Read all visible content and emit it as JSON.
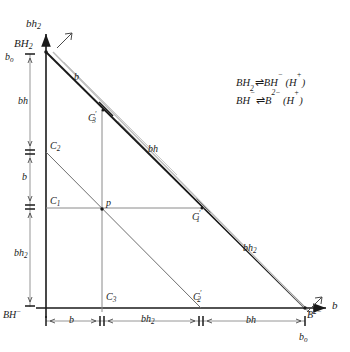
{
  "figure": {
    "axes": {
      "y_axis_label": "bh2",
      "x_axis_label": "b",
      "origin_label": "BH-",
      "apex_label": "BH2",
      "corner_label": "B2-",
      "apex_offset_label": "bo",
      "corner_offset_label": "bo"
    },
    "y_axis_segments": [
      {
        "name": "bh",
        "label": "bh"
      },
      {
        "name": "b",
        "label": "b"
      },
      {
        "name": "bh2",
        "label": "bh2"
      }
    ],
    "x_axis_segments": [
      {
        "name": "b",
        "label": "b"
      },
      {
        "name": "bh2",
        "label": "bh2"
      },
      {
        "name": "bh",
        "label": "bh"
      }
    ],
    "hypotenuse_segments": [
      {
        "name": "b",
        "label": "b"
      },
      {
        "name": "bh",
        "label": "bh"
      },
      {
        "name": "bh2",
        "label": "bh2"
      }
    ],
    "points": [
      {
        "name": "point-p",
        "label": "p",
        "x": 102,
        "y": 210
      },
      {
        "name": "point-c1",
        "label": "C1",
        "x": 46,
        "y": 207
      },
      {
        "name": "point-c2",
        "label": "C2",
        "x": 46,
        "y": 152
      },
      {
        "name": "point-c3",
        "label": "C3",
        "x": 102,
        "y": 308
      },
      {
        "name": "point-c1-prime",
        "label": "C1'",
        "x": 201,
        "y": 208
      },
      {
        "name": "point-c2-prime",
        "label": "C2'",
        "x": 201,
        "y": 308
      },
      {
        "name": "point-c3-prime",
        "label": "C3'",
        "x": 103,
        "y": 110
      }
    ],
    "equations": [
      {
        "left": "BH2",
        "arrow": "equilibrium",
        "right": "BH-",
        "paren": "(H+)"
      },
      {
        "left": "BH-",
        "arrow": "equilibrium",
        "right": "B2-",
        "paren": "(H+)"
      }
    ]
  },
  "labels": {
    "y_axis": "bh",
    "y_axis_sub": "2",
    "x_axis": "b",
    "apex": "BH",
    "apex_sub": "2",
    "apex_bo": "b",
    "apex_bo_sub": "o",
    "origin": "BH",
    "origin_sup": "−",
    "corner": "B",
    "corner_sup": "2−",
    "corner_bo": "b",
    "corner_bo_sub": "o",
    "seg_bh": "bh",
    "seg_b": "b",
    "seg_bh2": "bh",
    "seg_bh2_sub": "2",
    "p": "p",
    "c1": "C",
    "c1_sub": "1",
    "c2": "C",
    "c2_sub": "2",
    "c3": "C",
    "c3_sub": "3",
    "c1p": "C",
    "c1p_sub": "1",
    "c2p": "C",
    "c2p_sub": "2",
    "c3p": "C",
    "c3p_sub": "3",
    "prime": "′",
    "eq1_a": "BH",
    "eq1_a_sub": "2",
    "eq1_b": "BH",
    "eq1_b_sup": "−",
    "eq1_c": "(H",
    "eq1_c_sup": "+",
    "eq1_c_end": ")",
    "eq2_a": "BH",
    "eq2_a_sup": "−",
    "eq2_b": "B",
    "eq2_b_sup": "2−",
    "eq2_c": "(H",
    "eq2_c_sup": "+",
    "eq2_c_end": ")",
    "harpoon": "⇌"
  },
  "colors": {
    "ink": "#1a1a1a",
    "thin": "#6b6b6b",
    "ghost": "#b9b9b9",
    "background": "#ffffff"
  }
}
